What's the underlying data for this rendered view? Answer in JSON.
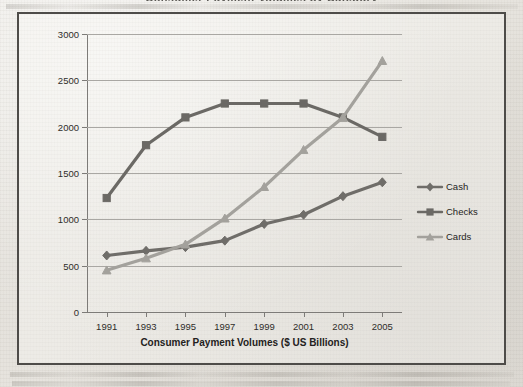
{
  "page": {
    "clipped_title": "Consumer Payment Volumes by Category",
    "background_color": "#e8e6e1",
    "frame_border_color": "#4e4c49"
  },
  "chart_data": {
    "type": "line",
    "title": "",
    "xlabel": "Consumer Payment Volumes ($ US Billions)",
    "ylabel": "",
    "categories": [
      "1991",
      "1993",
      "1995",
      "1997",
      "1999",
      "2001",
      "2003",
      "2005"
    ],
    "x": [
      1991,
      1993,
      1995,
      1997,
      1999,
      2001,
      2003,
      2005
    ],
    "ylim": [
      0,
      3000
    ],
    "yticks": [
      0,
      500,
      1000,
      1500,
      2000,
      2500,
      3000
    ],
    "ytick_labels": [
      "0",
      "500",
      "1000",
      "1500",
      "2000",
      "2500",
      "3000"
    ],
    "grid": true,
    "legend_position": "right",
    "series": [
      {
        "name": "Cash",
        "marker": "diamond",
        "color": "#6f6d69",
        "values": [
          610,
          660,
          700,
          770,
          950,
          1050,
          1250,
          1400
        ]
      },
      {
        "name": "Checks",
        "marker": "square",
        "color": "#6b6965",
        "values": [
          1230,
          1800,
          2100,
          2250,
          2250,
          2250,
          2100,
          1890
        ]
      },
      {
        "name": "Cards",
        "marker": "triangle",
        "color": "#a3a19c",
        "values": [
          450,
          580,
          730,
          1010,
          1350,
          1750,
          2100,
          2710
        ]
      }
    ]
  },
  "legend": {
    "items": [
      {
        "label": "Cash",
        "marker": "diamond-marker-icon"
      },
      {
        "label": "Checks",
        "marker": "square-marker-icon"
      },
      {
        "label": "Cards",
        "marker": "triangle-marker-icon"
      }
    ]
  }
}
